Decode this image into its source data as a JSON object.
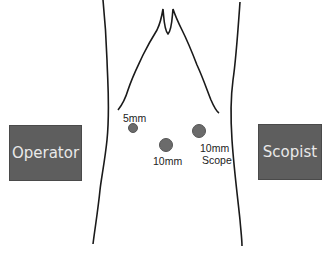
{
  "diagram": {
    "positions": {
      "operator": {
        "label": "Operator"
      },
      "scopist": {
        "label": "Scopist"
      }
    },
    "ports": [
      {
        "id": "port-5mm",
        "label": "5mm"
      },
      {
        "id": "port-10mm",
        "label": "10mm"
      },
      {
        "id": "port-10mm-scope",
        "label_line1": "10mm",
        "label_line2": "Scope"
      }
    ],
    "colors": {
      "box_fill": "#5e5e5e",
      "box_text": "#e9e9e9",
      "port_fill": "#6b6b6b",
      "outline": "#1a1a1a"
    }
  }
}
